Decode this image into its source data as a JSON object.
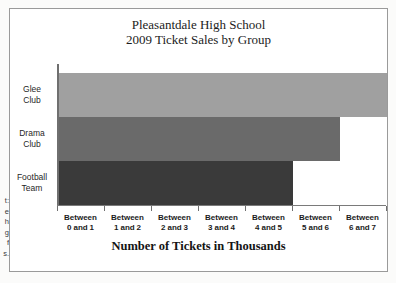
{
  "figure": {
    "title_line1": "Pleasantdale High School",
    "title_line2": "2009 Ticket Sales by Group",
    "x_axis_title": "Number of Tickets in Thousands",
    "border_color": "#9a9a9a"
  },
  "margin_note": {
    "line1": "t:",
    "line2": "e",
    "line3": "h",
    "line4": "g",
    "line5": "f",
    "line6": "s."
  },
  "chart_data": {
    "type": "bar",
    "orientation": "horizontal",
    "title": "Pleasantdale High School 2009 Ticket Sales by Group",
    "xlabel": "Number of Tickets in Thousands",
    "ylabel": "",
    "grid": false,
    "legend": false,
    "xlim": [
      0,
      7
    ],
    "categories": [
      "Glee Club",
      "Drama Club",
      "Football Team"
    ],
    "values": [
      7.0,
      6.0,
      5.0
    ],
    "bar_colors": [
      "#a0a0a0",
      "#6a6a6a",
      "#3a3a3a"
    ],
    "bars": [
      {
        "label_line1": "Glee",
        "label_line2": "Club",
        "value": 7.0,
        "color": "#a0a0a0",
        "bin": "Between 6 and 7"
      },
      {
        "label_line1": "Drama",
        "label_line2": "Club",
        "value": 6.0,
        "color": "#6a6a6a",
        "bin": "Between 5 and 6"
      },
      {
        "label_line1": "Football",
        "label_line2": "Team",
        "value": 5.0,
        "color": "#3a3a3a",
        "bin": "Between 4 and 5"
      }
    ],
    "tick_labels": [
      {
        "line1": "Between",
        "line2": "0 and 1"
      },
      {
        "line1": "Between",
        "line2": "1 and 2"
      },
      {
        "line1": "Between",
        "line2": "2 and 3"
      },
      {
        "line1": "Between",
        "line2": "3 and 4"
      },
      {
        "line1": "Between",
        "line2": "4 and 5"
      },
      {
        "line1": "Between",
        "line2": "5 and 6"
      },
      {
        "line1": "Between",
        "line2": "6 and 7"
      }
    ],
    "tick_values": [
      0,
      1,
      2,
      3,
      4,
      5,
      6,
      7
    ]
  }
}
